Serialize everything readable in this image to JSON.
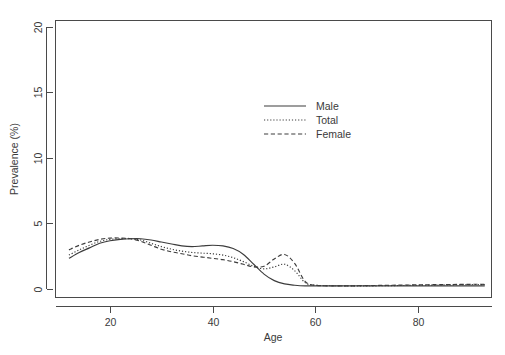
{
  "chart_data": {
    "type": "line",
    "title": "",
    "subtitle": "",
    "xlabel": "Age",
    "ylabel": "Prevalence (%)",
    "xlim": [
      11,
      93
    ],
    "ylim": [
      0,
      21
    ],
    "xticks": [
      20,
      40,
      60,
      80
    ],
    "yticks": [
      0,
      5,
      10,
      15,
      20
    ],
    "xtick_labels": [
      "20",
      "40",
      "60",
      "80"
    ],
    "ytick_labels": [
      "0",
      "5",
      "10",
      "15",
      "20"
    ],
    "grid": false,
    "legend_position": "upper-center-right",
    "x": [
      12,
      14,
      16,
      18,
      20,
      22,
      24,
      26,
      28,
      30,
      32,
      34,
      36,
      38,
      40,
      42,
      44,
      46,
      48,
      50,
      52,
      54,
      56,
      58,
      60,
      65,
      70,
      75,
      80,
      85,
      90,
      93
    ],
    "series": [
      {
        "name": "Male",
        "style": "solid",
        "values": [
          2.3,
          2.75,
          3.1,
          3.45,
          3.65,
          3.75,
          3.8,
          3.8,
          3.7,
          3.55,
          3.4,
          3.25,
          3.2,
          3.25,
          3.3,
          3.25,
          3.05,
          2.6,
          1.85,
          1.1,
          0.6,
          0.35,
          0.25,
          0.2,
          0.2,
          0.2,
          0.2,
          0.2,
          0.2,
          0.2,
          0.2,
          0.2
        ]
      },
      {
        "name": "Total",
        "style": "dotted",
        "values": [
          2.55,
          2.95,
          3.3,
          3.6,
          3.75,
          3.8,
          3.8,
          3.7,
          3.45,
          3.2,
          3.0,
          2.85,
          2.75,
          2.7,
          2.65,
          2.55,
          2.35,
          2.05,
          1.7,
          1.5,
          1.65,
          1.85,
          1.35,
          0.45,
          0.25,
          0.2,
          0.2,
          0.22,
          0.25,
          0.27,
          0.3,
          0.3
        ]
      },
      {
        "name": "Female",
        "style": "dashed",
        "values": [
          2.95,
          3.3,
          3.55,
          3.75,
          3.85,
          3.85,
          3.8,
          3.6,
          3.3,
          3.0,
          2.8,
          2.65,
          2.5,
          2.4,
          2.3,
          2.2,
          2.05,
          1.85,
          1.65,
          1.7,
          2.25,
          2.6,
          1.9,
          0.55,
          0.25,
          0.2,
          0.22,
          0.25,
          0.28,
          0.3,
          0.32,
          0.32
        ]
      }
    ],
    "legend": [
      {
        "label": "Male",
        "style": "solid"
      },
      {
        "label": "Total",
        "style": "dotted"
      },
      {
        "label": "Female",
        "style": "dashed"
      }
    ],
    "colors": {
      "line": "#3c3c3c",
      "axis": "#4a4a4a",
      "text": "#3a3a3a",
      "background": "#ffffff"
    }
  }
}
